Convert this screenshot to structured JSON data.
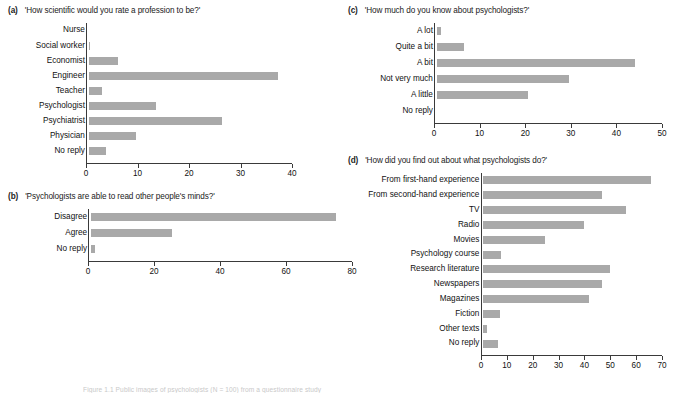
{
  "figure": {
    "caption": "Figure 1.1  Public images of psychologists (N = 100) from a questionnaire study",
    "bar_color": "#a9a9a9",
    "axis_color": "#3a3a3a"
  },
  "chart_data": [
    {
      "id": "a",
      "type": "bar",
      "orientation": "horizontal",
      "tag": "(a)",
      "title": "'How scientific would you rate a profession to be?'",
      "categories": [
        "Nurse",
        "Social worker",
        "Economist",
        "Engineer",
        "Teacher",
        "Psychologist",
        "Psychiatrist",
        "Physician",
        "No reply"
      ],
      "values": [
        0,
        0.3,
        5.6,
        36.8,
        2.6,
        13,
        25.8,
        9.1,
        3.4
      ],
      "xlabel": "",
      "ylabel": "",
      "xlim": [
        0,
        40
      ],
      "xticks": [
        0,
        10,
        20,
        30,
        40
      ],
      "xticklabels": [
        "0",
        "10",
        "20",
        "30",
        "40"
      ],
      "grid": false,
      "legend": false
    },
    {
      "id": "b",
      "type": "bar",
      "orientation": "horizontal",
      "tag": "(b)",
      "title": "'Psychologists are able to read other people's minds?'",
      "categories": [
        "Disagree",
        "Agree",
        "No reply"
      ],
      "values": [
        74.2,
        24.6,
        1.2
      ],
      "xlabel": "",
      "ylabel": "",
      "xlim": [
        0,
        80
      ],
      "xticks": [
        0,
        20,
        40,
        60,
        80
      ],
      "xticklabels": [
        "0",
        "20",
        "40",
        "60",
        "80"
      ],
      "grid": false,
      "legend": false
    },
    {
      "id": "c",
      "type": "bar",
      "orientation": "horizontal",
      "tag": "(c)",
      "title": "'How much do you know about psychologists?'",
      "categories": [
        "A lot",
        "Quite a bit",
        "A bit",
        "Not very much",
        "A little",
        "No reply"
      ],
      "values": [
        1,
        6,
        43.5,
        29,
        20,
        0
      ],
      "xlabel": "",
      "ylabel": "",
      "xlim": [
        0,
        50
      ],
      "xticks": [
        0,
        10,
        20,
        30,
        40,
        50
      ],
      "xticklabels": [
        "0",
        "10",
        "20",
        "30",
        "40",
        "50"
      ],
      "grid": false,
      "legend": false
    },
    {
      "id": "d",
      "type": "bar",
      "orientation": "horizontal",
      "tag": "(d)",
      "title": "'How did you find out about what psychologists do?'",
      "categories": [
        "From first-hand experience",
        "From second-hand experience",
        "TV",
        "Radio",
        "Movies",
        "Psychology course",
        "Research literature",
        "Newspapers",
        "Magazines",
        "Fiction",
        "Other texts",
        "No reply"
      ],
      "values": [
        65,
        46,
        55,
        39,
        24,
        7,
        49,
        46,
        41,
        6.5,
        1.5,
        5.5
      ],
      "xlabel": "",
      "ylabel": "",
      "xlim": [
        0,
        70
      ],
      "xticks": [
        0,
        10,
        20,
        30,
        40,
        50,
        60,
        70
      ],
      "xticklabels": [
        "0",
        "10",
        "20",
        "30",
        "40",
        "50",
        "60",
        "70"
      ],
      "grid": false,
      "legend": false
    }
  ]
}
